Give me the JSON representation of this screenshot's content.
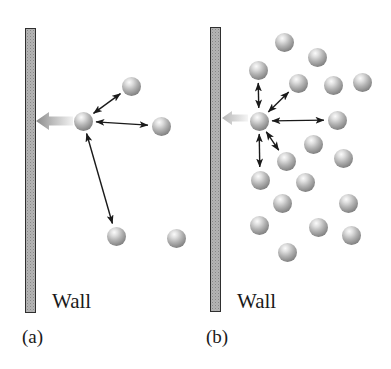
{
  "figure": {
    "background": "#ffffff",
    "bond_arrow_color": "#1a1a1a",
    "molecule_diameter": 19,
    "panels": [
      {
        "id": "a",
        "caption": "(a)",
        "wall_label": "Wall",
        "wall": {
          "x": 25,
          "y": 28,
          "width": 11,
          "height": 285
        },
        "net_force_arrow": {
          "tip_x": 36,
          "tail_x": 73,
          "y": 121,
          "head_len": 13,
          "head_half": 9,
          "body_half": 4.5,
          "head_color": "#8a8a8a",
          "mid_color": "#bcbcbc",
          "tail_color": "#f2f2f2"
        },
        "central_molecule": {
          "x": 83,
          "y": 121
        },
        "molecules": [
          {
            "x": 131,
            "y": 86,
            "bonded": true
          },
          {
            "x": 161,
            "y": 126,
            "bonded": true
          },
          {
            "x": 116,
            "y": 236,
            "bonded": true
          },
          {
            "x": 176,
            "y": 238,
            "bonded": false
          }
        ]
      },
      {
        "id": "b",
        "caption": "(b)",
        "wall_label": "Wall",
        "wall": {
          "x": 210,
          "y": 27,
          "width": 11,
          "height": 285
        },
        "net_force_arrow": {
          "tip_x": 222,
          "tail_x": 248,
          "y": 118,
          "head_len": 10,
          "head_half": 7,
          "body_half": 3.5,
          "head_color": "#b5b5b5",
          "mid_color": "#d2d2d2",
          "tail_color": "#f5f5f5"
        },
        "central_molecule": {
          "x": 259,
          "y": 121
        },
        "molecules": [
          {
            "x": 284,
            "y": 42,
            "bonded": false
          },
          {
            "x": 317,
            "y": 57,
            "bonded": false
          },
          {
            "x": 258,
            "y": 70,
            "bonded": true
          },
          {
            "x": 298,
            "y": 83,
            "bonded": true
          },
          {
            "x": 333,
            "y": 85,
            "bonded": false
          },
          {
            "x": 362,
            "y": 82,
            "bonded": false
          },
          {
            "x": 337,
            "y": 120,
            "bonded": true
          },
          {
            "x": 313,
            "y": 144,
            "bonded": false
          },
          {
            "x": 343,
            "y": 158,
            "bonded": false
          },
          {
            "x": 286,
            "y": 161,
            "bonded": true
          },
          {
            "x": 260,
            "y": 180,
            "bonded": true
          },
          {
            "x": 305,
            "y": 182,
            "bonded": false
          },
          {
            "x": 282,
            "y": 203,
            "bonded": false
          },
          {
            "x": 348,
            "y": 203,
            "bonded": false
          },
          {
            "x": 259,
            "y": 225,
            "bonded": false
          },
          {
            "x": 318,
            "y": 227,
            "bonded": false
          },
          {
            "x": 351,
            "y": 235,
            "bonded": false
          },
          {
            "x": 287,
            "y": 252,
            "bonded": false
          }
        ]
      }
    ]
  }
}
